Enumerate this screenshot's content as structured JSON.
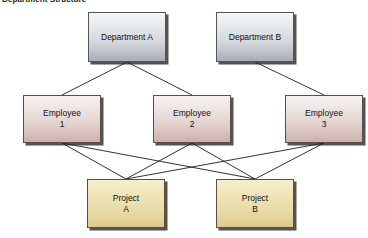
{
  "title": "Department Structure",
  "canvas": {
    "width": 368,
    "height": 238,
    "background": "#ffffff"
  },
  "colors": {
    "department_fill_top": "#f4f5f6",
    "department_fill_bottom": "#a8aeb6",
    "employee_fill_top": "#f6f2f1",
    "employee_fill_bottom": "#cbb0ab",
    "project_fill_top": "#f6eecd",
    "project_fill_bottom": "#dcc98d",
    "border": "#4a4a4a",
    "edge_line": "#1c1c1c",
    "shadow": "#28231e",
    "text": "#111111"
  },
  "nodes": [
    {
      "id": "deptA",
      "label": "Department A",
      "type": "department",
      "x": 88,
      "y": 12,
      "w": 78,
      "h": 50
    },
    {
      "id": "deptB",
      "label": "Department B",
      "type": "department",
      "x": 216,
      "y": 12,
      "w": 78,
      "h": 50
    },
    {
      "id": "emp1",
      "label": "Employee\n1",
      "type": "employee",
      "x": 23,
      "y": 95,
      "w": 78,
      "h": 48
    },
    {
      "id": "emp2",
      "label": "Employee\n2",
      "type": "employee",
      "x": 153,
      "y": 95,
      "w": 78,
      "h": 48
    },
    {
      "id": "emp3",
      "label": "Employee\n3",
      "type": "employee",
      "x": 285,
      "y": 95,
      "w": 78,
      "h": 48
    },
    {
      "id": "projA",
      "label": "Project\nA",
      "type": "project",
      "x": 87,
      "y": 179,
      "w": 78,
      "h": 49
    },
    {
      "id": "projB",
      "label": "Project\nB",
      "type": "project",
      "x": 216,
      "y": 179,
      "w": 78,
      "h": 49
    }
  ],
  "edges": [
    {
      "from": "deptA",
      "to": "emp1"
    },
    {
      "from": "deptA",
      "to": "emp2"
    },
    {
      "from": "deptB",
      "to": "emp3"
    },
    {
      "from": "emp1",
      "to": "projA"
    },
    {
      "from": "emp2",
      "to": "projA"
    },
    {
      "from": "emp3",
      "to": "projA"
    },
    {
      "from": "emp1",
      "to": "projB"
    },
    {
      "from": "emp2",
      "to": "projB"
    },
    {
      "from": "emp3",
      "to": "projB"
    }
  ],
  "labels": {
    "deptA": "Department A",
    "deptB": "Department B",
    "emp1_line1": "Employee",
    "emp1_line2": "1",
    "emp2_line1": "Employee",
    "emp2_line2": "2",
    "emp3_line1": "Employee",
    "emp3_line2": "3",
    "projA_line1": "Project",
    "projA_line2": "A",
    "projB_line1": "Project",
    "projB_line2": "B"
  }
}
